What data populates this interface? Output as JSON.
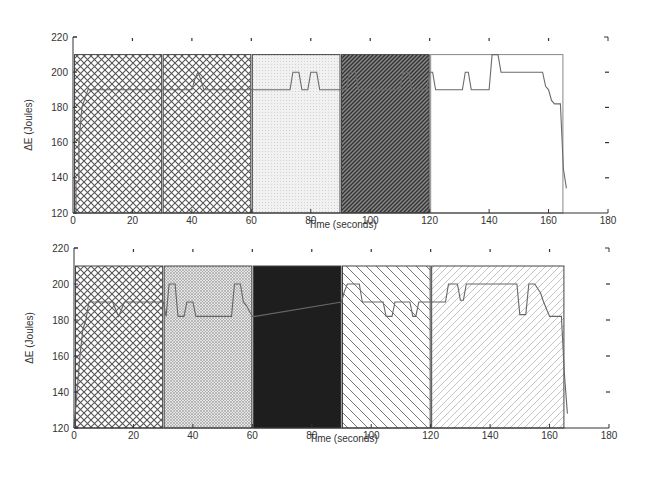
{
  "chart_data": [
    {
      "type": "line",
      "panel": "top",
      "title": "",
      "xlabel": "Time (seconds)",
      "ylabel": "ΔE (Joules)",
      "xlim": [
        0,
        180
      ],
      "ylim": [
        120,
        220
      ],
      "xticks": [
        0,
        20,
        40,
        60,
        80,
        100,
        120,
        140,
        160,
        180
      ],
      "yticks": [
        120,
        140,
        160,
        180,
        200,
        220
      ],
      "grid": false,
      "regions": [
        {
          "x0": 0,
          "x1": 30,
          "top": 210,
          "fill": "crosshatch"
        },
        {
          "x0": 30,
          "x1": 60,
          "top": 210,
          "fill": "crosshatch"
        },
        {
          "x0": 60,
          "x1": 90,
          "top": 210,
          "fill": "light-dots"
        },
        {
          "x0": 90,
          "x1": 120,
          "top": 210,
          "fill": "dark-diagonal"
        },
        {
          "x0": 120,
          "x1": 165,
          "top": 210,
          "fill": "none"
        }
      ],
      "series": [
        {
          "name": "ΔE",
          "x": [
            0,
            1,
            1,
            2,
            2,
            3,
            4,
            5,
            40,
            41,
            42,
            43,
            44,
            73,
            74,
            76,
            77,
            79,
            80,
            82,
            83,
            92,
            93,
            95,
            96,
            110,
            111,
            113,
            114,
            119,
            120,
            121,
            122,
            131,
            132,
            133,
            134,
            140,
            141,
            143,
            144,
            158,
            159,
            160,
            161,
            162,
            164,
            165,
            166
          ],
          "y": [
            120,
            120,
            138,
            138,
            160,
            180,
            185,
            190,
            190,
            196,
            200,
            196,
            190,
            190,
            200,
            200,
            190,
            190,
            200,
            200,
            190,
            190,
            200,
            200,
            190,
            190,
            200,
            200,
            190,
            190,
            200,
            200,
            190,
            190,
            200,
            200,
            190,
            190,
            210,
            210,
            200,
            200,
            192,
            190,
            184,
            182,
            182,
            145,
            134
          ]
        }
      ]
    },
    {
      "type": "line",
      "panel": "bottom",
      "title": "",
      "xlabel": "Time (seconds)",
      "ylabel": "ΔE (Joules)",
      "xlim": [
        0,
        180
      ],
      "ylim": [
        120,
        220
      ],
      "xticks": [
        0,
        20,
        40,
        60,
        80,
        100,
        120,
        140,
        160,
        180
      ],
      "yticks": [
        120,
        140,
        160,
        180,
        200,
        220
      ],
      "grid": false,
      "regions": [
        {
          "x0": 0,
          "x1": 30,
          "top": 210,
          "fill": "crosshatch"
        },
        {
          "x0": 30,
          "x1": 60,
          "top": 210,
          "fill": "fine-gray-crosshatch"
        },
        {
          "x0": 60,
          "x1": 90,
          "top": 210,
          "fill": "solid-black"
        },
        {
          "x0": 90,
          "x1": 120,
          "top": 210,
          "fill": "back-diagonal"
        },
        {
          "x0": 120,
          "x1": 165,
          "top": 210,
          "fill": "light-diagonal"
        }
      ],
      "series": [
        {
          "name": "ΔE",
          "x": [
            0,
            1,
            2,
            3,
            4,
            5,
            13,
            14,
            15,
            16,
            17,
            30,
            31,
            32,
            34,
            35,
            37,
            38,
            40,
            41,
            42,
            43,
            53,
            54,
            56,
            57,
            58,
            60,
            61,
            90,
            91,
            92,
            96,
            97,
            98,
            104,
            105,
            107,
            108,
            113,
            114,
            115,
            116,
            117,
            125,
            126,
            128,
            129,
            130,
            131,
            132,
            149,
            150,
            152,
            153,
            155,
            157,
            158,
            160,
            164,
            165,
            166
          ],
          "y": [
            120,
            140,
            160,
            175,
            180,
            190,
            190,
            186,
            182,
            186,
            190,
            190,
            182,
            200,
            200,
            182,
            182,
            190,
            190,
            182,
            182,
            182,
            182,
            200,
            200,
            190,
            188,
            182,
            182,
            190,
            196,
            200,
            200,
            190,
            190,
            190,
            182,
            182,
            190,
            190,
            182,
            182,
            190,
            190,
            190,
            200,
            200,
            200,
            191,
            191,
            200,
            200,
            183,
            183,
            200,
            200,
            195,
            190,
            182,
            182,
            150,
            128
          ]
        }
      ]
    }
  ],
  "panels": {
    "top": {
      "xlabel": "Time (seconds)",
      "ylabel": "ΔE (Joules)"
    },
    "bottom": {
      "xlabel": "Time (seconds)",
      "ylabel": "ΔE (Joules)"
    }
  },
  "colors": {
    "axis": "#333333",
    "line": "#555555",
    "hatch": "#555555",
    "dark_fill": "#222222",
    "region_border": "#444444"
  }
}
